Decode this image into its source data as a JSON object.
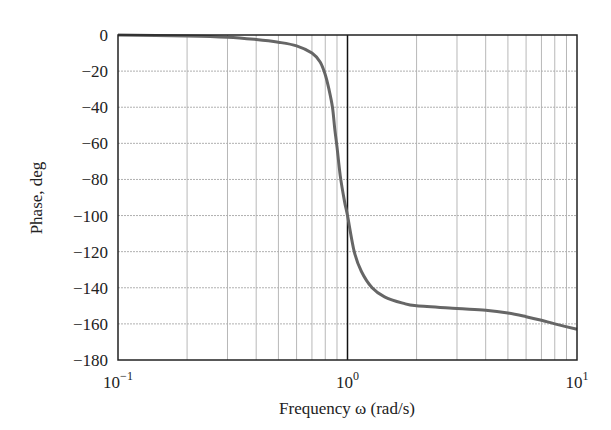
{
  "chart_data": {
    "type": "line",
    "title": "",
    "xlabel": "Frequency ω (rad/s)",
    "ylabel": "Phase, deg",
    "xscale": "log",
    "xlim": [
      0.1,
      10
    ],
    "ylim": [
      -180,
      0
    ],
    "grid": true,
    "legend": null,
    "x_ticks": [
      0.1,
      1,
      10
    ],
    "x_tick_labels": [
      {
        "base": "10",
        "exp": "−1"
      },
      {
        "base": "10",
        "exp": "0"
      },
      {
        "base": "10",
        "exp": "1"
      }
    ],
    "y_ticks": [
      0,
      -20,
      -40,
      -60,
      -80,
      -100,
      -120,
      -140,
      -160,
      -180
    ],
    "y_tick_labels": [
      "0",
      "−20",
      "−40",
      "−60",
      "−80",
      "−100",
      "−120",
      "−140",
      "−160",
      "−180"
    ],
    "annotations": [
      {
        "type": "vline",
        "x": 1,
        "color": "#111111"
      }
    ],
    "series": [
      {
        "name": "Phase",
        "color": "#666666",
        "x": [
          0.1,
          0.2,
          0.3,
          0.4,
          0.5,
          0.6,
          0.7,
          0.76,
          0.8,
          0.83,
          0.86,
          0.88,
          0.9,
          0.93,
          0.97,
          1.0,
          1.07,
          1.15,
          1.28,
          1.45,
          1.74,
          2.0,
          3.0,
          4.0,
          5.0,
          6.0,
          7.0,
          8.0,
          10.0
        ],
        "y": [
          0,
          -0.5,
          -1.2,
          -2.5,
          -4,
          -6,
          -10,
          -15,
          -22,
          -30,
          -40,
          -52,
          -62,
          -78,
          -92,
          -100,
          -120,
          -131,
          -140,
          -145,
          -148.5,
          -150,
          -151.5,
          -152.5,
          -154,
          -156,
          -158,
          -160,
          -163
        ]
      }
    ]
  }
}
